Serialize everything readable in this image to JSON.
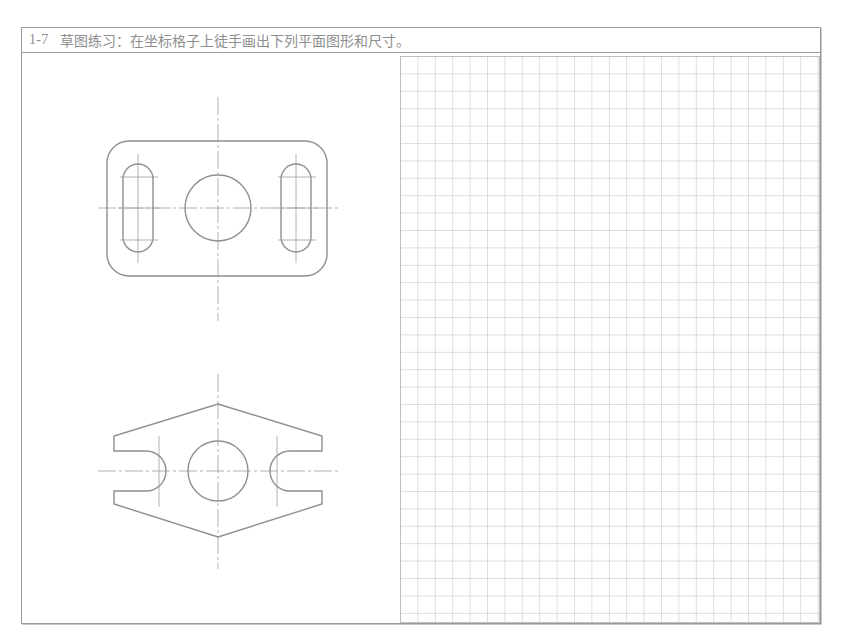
{
  "document": {
    "title_number": "1-7",
    "title_text": "草图练习：在坐标格子上徒手画出下列平面图形和尺寸。",
    "frame_color": "#9a9a9a",
    "line_color": "#8f8f8f",
    "centerline_color": "#a9a9a9",
    "grid_color": "#b9b9b9",
    "background": "#ffffff"
  },
  "grid": {
    "cell_size": 17.4,
    "columns": 24,
    "rows": 32,
    "line_width": 0.8
  },
  "figures": [
    {
      "id": "figure-1",
      "name": "rounded-rectangle-plate",
      "outline": {
        "type": "rounded-rect",
        "x": 85,
        "y": 142,
        "width": 220,
        "height": 135,
        "corner_radius": 22
      },
      "center_hole": {
        "type": "circle",
        "cx": 196,
        "cy": 209,
        "r": 33
      },
      "slots": [
        {
          "type": "obround",
          "cx": 116,
          "cy": 209,
          "width": 30,
          "height": 88
        },
        {
          "type": "obround",
          "cx": 274,
          "cy": 209,
          "width": 30,
          "height": 88
        }
      ],
      "centerlines": {
        "horizontal": {
          "x1": 76,
          "x2": 316,
          "y": 209
        },
        "vertical": {
          "y1": 98,
          "y2": 322,
          "x": 196
        },
        "slot_horizontals": [
          {
            "x1": 96,
            "x2": 138,
            "y": 209
          },
          {
            "x1": 254,
            "x2": 296,
            "y": 209
          }
        ],
        "slot_verticals": [
          {
            "y1": 155,
            "y2": 264,
            "x": 116
          },
          {
            "y1": 155,
            "y2": 264,
            "x": 274
          }
        ],
        "slot_arc_marks": [
          {
            "x1": 96,
            "x2": 138,
            "y": 178
          },
          {
            "x1": 96,
            "x2": 138,
            "y": 241
          },
          {
            "x1": 254,
            "x2": 296,
            "y": 178
          },
          {
            "x1": 254,
            "x2": 296,
            "y": 241
          }
        ]
      }
    },
    {
      "id": "figure-2",
      "name": "hexagonal-plate-with-open-slots",
      "outline": {
        "type": "hexagon",
        "points": "92,437 151,405 196,405 241,405 300,437 300,470 300,504 241,538 196,538 151,538 92,504",
        "left_x": 92,
        "right_x": 300,
        "top_y": 405,
        "bottom_y": 538,
        "mid_top_y": 437,
        "mid_bottom_y": 504,
        "apex_x": 196
      },
      "center_hole": {
        "type": "circle",
        "cx": 196,
        "cy": 472,
        "r": 30
      },
      "open_slots": [
        {
          "side": "left",
          "mouth_x": 92,
          "depth_x": 144,
          "half_height": 20,
          "cy": 472
        },
        {
          "side": "right",
          "mouth_x": 300,
          "depth_x": 248,
          "half_height": 20,
          "cy": 472
        }
      ],
      "centerlines": {
        "horizontal": {
          "x1": 76,
          "x2": 316,
          "y": 472
        },
        "vertical": {
          "y1": 375,
          "y2": 570,
          "x": 196
        },
        "slot_verticals": [
          {
            "y1": 437,
            "y2": 508,
            "x": 137
          },
          {
            "y1": 437,
            "y2": 508,
            "x": 255
          }
        ]
      }
    }
  ]
}
